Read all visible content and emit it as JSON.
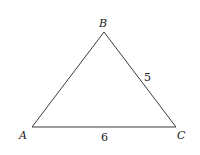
{
  "diagram": {
    "type": "triangle",
    "stroke_color": "#3a3a3a",
    "vertices": [
      {
        "name": "A",
        "label": "A",
        "x": 32,
        "y": 127
      },
      {
        "name": "B",
        "label": "B",
        "x": 104,
        "y": 32
      },
      {
        "name": "C",
        "label": "C",
        "x": 176,
        "y": 127
      }
    ],
    "side_labels": {
      "BC": "5",
      "AC": "6"
    }
  }
}
